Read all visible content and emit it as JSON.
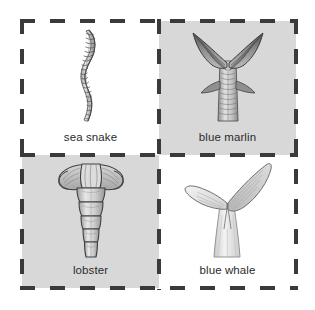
{
  "figure": {
    "layout": "2x2-grid",
    "border_style": "dashed",
    "border_color": "#3a3a3a",
    "page_background": "#ffffff",
    "shaded_panel_color": "#d8d8d8",
    "caption_color": "#2b2b2b"
  },
  "cells": [
    {
      "position": "top-left",
      "label": "sea snake",
      "icon": "sea-snake-tail-illustration",
      "background": "plain",
      "background_color": "#ffffff"
    },
    {
      "position": "top-right",
      "label": "blue marlin",
      "icon": "blue-marlin-tail-illustration",
      "background": "shaded",
      "background_color": "#d8d8d8"
    },
    {
      "position": "bottom-left",
      "label": "lobster",
      "icon": "lobster-tail-illustration",
      "background": "shaded",
      "background_color": "#d8d8d8"
    },
    {
      "position": "bottom-right",
      "label": "blue whale",
      "icon": "blue-whale-fluke-illustration",
      "background": "plain",
      "background_color": "#ffffff"
    }
  ]
}
